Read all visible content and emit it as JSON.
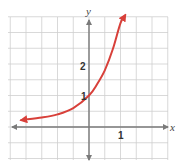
{
  "chart_data": {
    "type": "line",
    "title": "",
    "xlabel": "x",
    "ylabel": "y",
    "x_tick_labels": [
      {
        "value": 1,
        "label": "1"
      }
    ],
    "y_tick_labels": [
      {
        "value": 1,
        "label": "1"
      },
      {
        "value": 2,
        "label": "2"
      }
    ],
    "grid": true,
    "grid_step": 0.5,
    "xlim": [
      -2.5,
      2.5
    ],
    "ylim": [
      -1.0,
      3.5
    ],
    "series": [
      {
        "name": "exponential curve",
        "description": "increasing exponential, passes through (0,1), arrows at both ends",
        "color": "#d8403a",
        "x": [
          -2.15,
          -1.5,
          -1.0,
          -0.5,
          0,
          0.25,
          0.5,
          0.75,
          1.0,
          1.15
        ],
        "y": [
          0.22,
          0.3,
          0.4,
          0.6,
          1.0,
          1.35,
          1.8,
          2.45,
          3.3,
          3.55
        ]
      }
    ],
    "annotations": [
      {
        "text": "1",
        "at": "y-axis intercept (0,1)"
      },
      {
        "text": "2",
        "at": "y = 2 on y-axis"
      },
      {
        "text": "1",
        "at": "x = 1 on x-axis"
      }
    ]
  },
  "labels": {
    "x_axis": "x",
    "y_axis": "y",
    "y_tick_1": "1",
    "y_tick_2": "2",
    "x_tick_1": "1"
  },
  "colors": {
    "curve": "#d8403a",
    "axis": "#7a7a7a",
    "grid": "#cfcfcf"
  }
}
